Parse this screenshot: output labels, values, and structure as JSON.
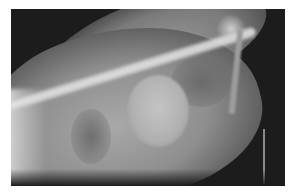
{
  "image": {
    "description": "Lateral thoracic radiograph (X-ray) of an animal",
    "alt": "X-ray showing spine, rib cage, rounded cardiac silhouette and abdomen",
    "colors": {
      "background": "#ffffff",
      "film_dark": "#1c1c1c",
      "tissue": "#8e8e8e",
      "bone": "#eeeeee"
    }
  }
}
